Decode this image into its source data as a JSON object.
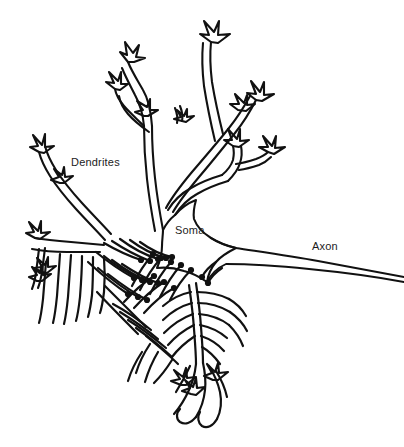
{
  "figure": {
    "kind": "neuron-line-drawing",
    "background_color": "#ffffff",
    "ink_color": "#111111",
    "width": 404,
    "height": 447
  },
  "labels": {
    "dendrites": "Dendrites",
    "soma": "Soma",
    "axon": "Axon"
  },
  "caption": {
    "text": ""
  },
  "parts": {
    "dendrite_tree_name": "dendrite-tree",
    "soma_name": "soma-body",
    "axon_name": "axon-fiber",
    "terminals_name": "synaptic-terminals"
  }
}
